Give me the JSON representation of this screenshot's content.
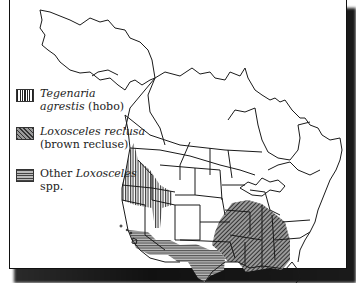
{
  "map": {
    "title": "Range of hobo spider and Loxosceles species in North America",
    "region": "North America (Canada, United States, Alaska)",
    "legend": [
      {
        "pattern": "vertical-lines",
        "name_italic": "Tegenaria",
        "name_italic_2": "agrestis",
        "common": " (hobo)"
      },
      {
        "pattern": "diagonal-lines",
        "name_italic": "Loxosceles reclusa",
        "common": "(brown recluse)"
      },
      {
        "pattern": "horizontal-lines",
        "prefix": "Other ",
        "name_italic": "Loxosceles",
        "suffix": "spp."
      }
    ],
    "ranges": {
      "hobo": "Pacific Northwest (WA, OR, ID, BC, western MT, northern UT)",
      "brown_recluse": "South-central and southeastern US (MO, AR, KS, OK, TX east, LA, MS, AL, TN, KY, GA, IL south, IN south, OH south)",
      "other_loxosceles": "Desert Southwest (southern CA, AZ, NM, west TX)"
    },
    "colors": {
      "ink": "#1a1a1a",
      "paper": "#ffffff",
      "shadow": "#151515"
    }
  }
}
